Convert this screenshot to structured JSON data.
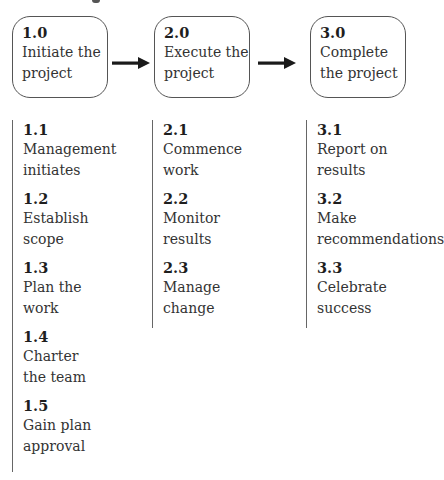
{
  "diagram": {
    "type": "process-flow",
    "phases": [
      {
        "number": "1.0",
        "title": "Initiate the\nproject",
        "tasks": [
          {
            "number": "1.1",
            "label": "Management\ninitiates"
          },
          {
            "number": "1.2",
            "label": "Establish\nscope"
          },
          {
            "number": "1.3",
            "label": "Plan the\nwork"
          },
          {
            "number": "1.4",
            "label": "Charter\nthe team"
          },
          {
            "number": "1.5",
            "label": "Gain plan\napproval"
          }
        ]
      },
      {
        "number": "2.0",
        "title": "Execute the\nproject",
        "tasks": [
          {
            "number": "2.1",
            "label": "Commence\nwork"
          },
          {
            "number": "2.2",
            "label": "Monitor\nresults"
          },
          {
            "number": "2.3",
            "label": "Manage\nchange"
          }
        ]
      },
      {
        "number": "3.0",
        "title": "Complete\nthe project",
        "tasks": [
          {
            "number": "3.1",
            "label": "Report on\nresults"
          },
          {
            "number": "3.2",
            "label": "Make\nrecommendations"
          },
          {
            "number": "3.3",
            "label": "Celebrate\nsuccess"
          }
        ]
      }
    ],
    "connectors": [
      {
        "from": "1.0",
        "to": "2.0",
        "icon": "right-arrow-icon"
      },
      {
        "from": "2.0",
        "to": "3.0",
        "icon": "right-arrow-icon"
      }
    ],
    "colors": {
      "stroke": "#555555",
      "arrow": "#1a1a1a",
      "text": "#333333"
    }
  }
}
